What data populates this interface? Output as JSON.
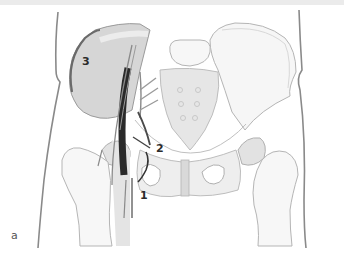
{
  "figure": {
    "panel_letter": "a",
    "labels": [
      {
        "id": "1",
        "text": "1"
      },
      {
        "id": "2",
        "text": "2"
      },
      {
        "id": "3",
        "text": "3"
      }
    ],
    "colors": {
      "bone_outline": "#b8b8b8",
      "bone_fill": "#f4f4f4",
      "shaded_region": "#d6d6d6",
      "iliacus_shading": "#cfcfcf",
      "nerve_dark": "#2a2a2a",
      "nerve_mid": "#6e6e6e",
      "body_outline": "#8a8a8a",
      "top_bar": "#ebebeb"
    }
  }
}
